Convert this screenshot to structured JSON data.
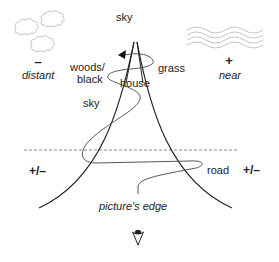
{
  "diagram": {
    "labels": {
      "sky_top": "sky",
      "woods_black_1": "woods/",
      "woods_black_2": "black",
      "house": "house",
      "grass": "grass",
      "sky_mid": "sky",
      "road": "road",
      "picture_edge": "picture's edge",
      "distant_sign": "–",
      "distant": "distant",
      "near_sign": "+",
      "near": "near",
      "left_pm": "+/–",
      "right_pm": "+/–"
    },
    "icons": {
      "clouds": "cloud-icon",
      "waves": "wave-icon",
      "eye": "eye-icon",
      "arrow": "arrowhead-icon"
    },
    "colors": {
      "line": "#222222",
      "light": "#bbbbbb",
      "dash": "#666666"
    }
  }
}
